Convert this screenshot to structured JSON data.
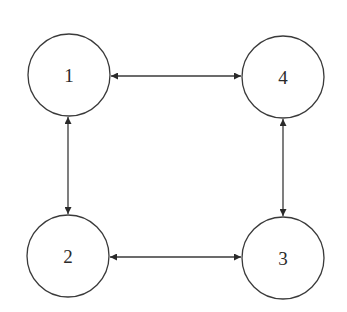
{
  "diagram": {
    "type": "graph",
    "stroke_color": "#3a3a3a",
    "nodes": [
      {
        "id": "1",
        "label": "1",
        "cx": 69,
        "cy": 75,
        "r": 41
      },
      {
        "id": "4",
        "label": "4",
        "cx": 283,
        "cy": 77,
        "r": 41
      },
      {
        "id": "2",
        "label": "2",
        "cx": 68,
        "cy": 256,
        "r": 41
      },
      {
        "id": "3",
        "label": "3",
        "cx": 283,
        "cy": 258,
        "r": 41
      }
    ],
    "edges": [
      {
        "from": "1",
        "to": "4",
        "bidirectional": true
      },
      {
        "from": "1",
        "to": "2",
        "bidirectional": true
      },
      {
        "from": "2",
        "to": "3",
        "bidirectional": true
      },
      {
        "from": "4",
        "to": "3",
        "bidirectional": true
      }
    ]
  }
}
